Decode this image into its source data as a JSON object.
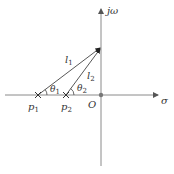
{
  "diagram": {
    "title": "",
    "axes": {
      "real_label": "σ",
      "imag_label": "jω",
      "origin_label": "O"
    },
    "poles": [
      {
        "label_main": "p",
        "label_sub": "1"
      },
      {
        "label_main": "p",
        "label_sub": "2"
      }
    ],
    "vectors": [
      {
        "label_main": "l",
        "label_sub": "1"
      },
      {
        "label_main": "l",
        "label_sub": "2"
      }
    ],
    "angles": [
      {
        "label_main": "θ",
        "label_sub": "1"
      },
      {
        "label_main": "θ",
        "label_sub": "2"
      }
    ],
    "colors": {
      "axis": "#8a8a8a",
      "line": "#444444",
      "text": "#333333"
    }
  }
}
